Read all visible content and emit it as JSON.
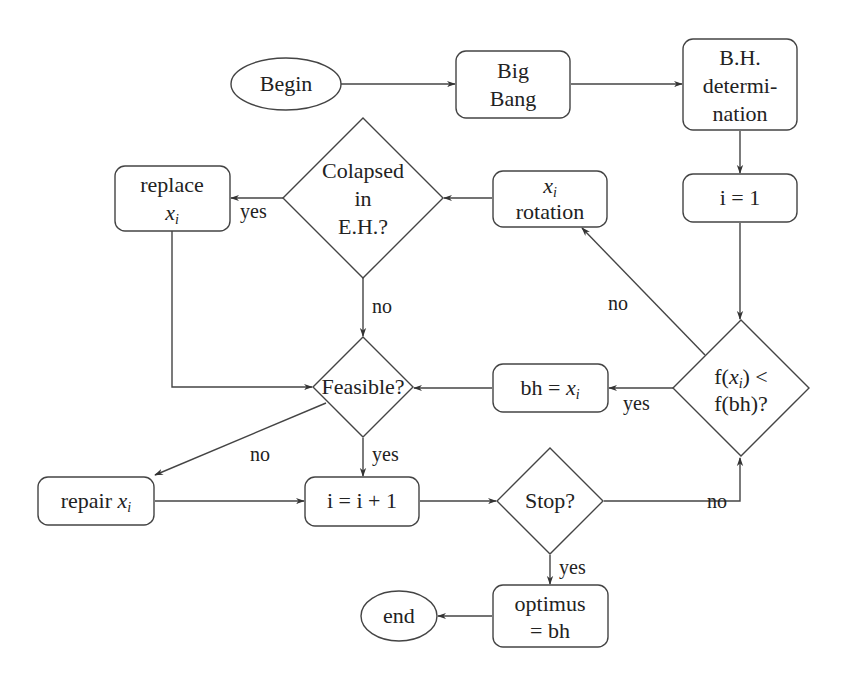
{
  "diagram": {
    "type": "flowchart",
    "nodes": {
      "begin": {
        "shape": "ellipse",
        "lines": [
          "Begin"
        ]
      },
      "big_bang": {
        "shape": "rounded-rect",
        "lines": [
          "Big",
          "Bang"
        ]
      },
      "bh_determination": {
        "shape": "rounded-rect",
        "lines": [
          "B.H.",
          "determi-",
          "nation"
        ]
      },
      "i_init": {
        "shape": "rounded-rect",
        "lines": [
          "i = 1"
        ]
      },
      "xi_rotation": {
        "shape": "rounded-rect",
        "lines": [
          "x",
          "rotation"
        ],
        "math_var": "x",
        "subscript": "i"
      },
      "collapsed": {
        "shape": "diamond",
        "lines": [
          "Colapsed",
          "in",
          "E.H.?"
        ]
      },
      "replace_xi": {
        "shape": "rounded-rect",
        "lines": [
          "replace",
          "x"
        ],
        "math_var": "x",
        "subscript": "i"
      },
      "feasible": {
        "shape": "diamond",
        "lines": [
          "Feasible?"
        ]
      },
      "bh_assign": {
        "shape": "rounded-rect",
        "text_prefix": "bh = ",
        "math_var": "x",
        "subscript": "i"
      },
      "compare": {
        "shape": "diamond",
        "line1_prefix": "f(",
        "line1_var": "x",
        "line1_sub": "i",
        "line1_suffix": ") <",
        "line2": "f(bh)?"
      },
      "repair_xi": {
        "shape": "rounded-rect",
        "text_prefix": "repair ",
        "math_var": "x",
        "subscript": "i"
      },
      "i_increment": {
        "shape": "rounded-rect",
        "lines": [
          "i = i + 1"
        ]
      },
      "stop": {
        "shape": "diamond",
        "lines": [
          "Stop?"
        ]
      },
      "optimus": {
        "shape": "rounded-rect",
        "lines": [
          "optimus",
          "= bh"
        ]
      },
      "end": {
        "shape": "ellipse",
        "lines": [
          "end"
        ]
      }
    },
    "edges": [
      {
        "from": "begin",
        "to": "big_bang",
        "label": ""
      },
      {
        "from": "big_bang",
        "to": "bh_determination",
        "label": ""
      },
      {
        "from": "bh_determination",
        "to": "i_init",
        "label": ""
      },
      {
        "from": "i_init",
        "to": "compare",
        "label": ""
      },
      {
        "from": "compare",
        "to": "xi_rotation",
        "label": "no"
      },
      {
        "from": "compare",
        "to": "bh_assign",
        "label": "yes"
      },
      {
        "from": "xi_rotation",
        "to": "collapsed",
        "label": ""
      },
      {
        "from": "collapsed",
        "to": "replace_xi",
        "label": "yes"
      },
      {
        "from": "collapsed",
        "to": "feasible",
        "label": "no"
      },
      {
        "from": "replace_xi",
        "to": "feasible",
        "label": ""
      },
      {
        "from": "bh_assign",
        "to": "feasible",
        "label": ""
      },
      {
        "from": "feasible",
        "to": "repair_xi",
        "label": "no"
      },
      {
        "from": "feasible",
        "to": "i_increment",
        "label": "yes"
      },
      {
        "from": "repair_xi",
        "to": "i_increment",
        "label": ""
      },
      {
        "from": "i_increment",
        "to": "stop",
        "label": ""
      },
      {
        "from": "stop",
        "to": "compare",
        "label": "no"
      },
      {
        "from": "stop",
        "to": "optimus",
        "label": "yes"
      },
      {
        "from": "optimus",
        "to": "end",
        "label": ""
      }
    ],
    "edge_labels": {
      "collapsed_yes": "yes",
      "collapsed_no": "no",
      "compare_no": "no",
      "compare_yes": "yes",
      "feasible_no": "no",
      "feasible_yes": "yes",
      "stop_no": "no",
      "stop_yes": "yes"
    },
    "colors": {
      "stroke": "#444444",
      "text": "#222222",
      "background": "#ffffff"
    }
  }
}
